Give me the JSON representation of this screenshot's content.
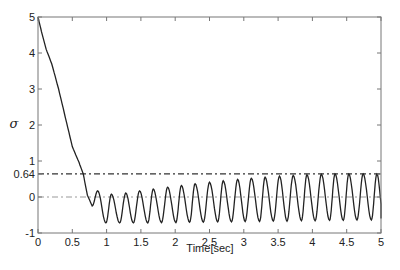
{
  "chart_data": {
    "type": "line",
    "title": "",
    "xlabel": "Time[sec]",
    "ylabel": "σ",
    "xlim": [
      0,
      5
    ],
    "ylim": [
      -1,
      5
    ],
    "grid": false,
    "legend": null,
    "x_ticks": [
      0,
      0.5,
      1,
      1.5,
      2,
      2.5,
      3,
      3.5,
      4,
      4.5,
      5
    ],
    "x_tick_labels": [
      "0",
      "0.5",
      "1",
      "1.5",
      "2",
      "2.5",
      "3",
      "3.5",
      "4",
      "4.5",
      "5"
    ],
    "y_ticks": [
      -1,
      0,
      0.64,
      1,
      2,
      3,
      4,
      5
    ],
    "y_tick_labels": [
      "-1",
      "0",
      "0.64",
      "1",
      "2",
      "3",
      "4",
      "5"
    ],
    "reference_lines": [
      {
        "name": "upper bound",
        "y": 0.64,
        "style": "dash-dot",
        "color": "#333333"
      },
      {
        "name": "zero",
        "y": 0,
        "style": "dash-dot",
        "color": "#999999"
      }
    ],
    "series": [
      {
        "name": "sigma",
        "color": "#222222",
        "descent": {
          "t": [
            0,
            0.05,
            0.12,
            0.2,
            0.3,
            0.4,
            0.5,
            0.6,
            0.66,
            0.72,
            0.79
          ],
          "y": [
            5,
            4.6,
            4.1,
            3.7,
            3.0,
            2.2,
            1.4,
            0.95,
            0.64,
            0.05,
            -0.25
          ]
        },
        "extrema": {
          "t": [
            0.79,
            0.87,
            0.99,
            1.07,
            1.19,
            1.28,
            1.39,
            1.48,
            1.6,
            1.68,
            1.8,
            1.89,
            2.01,
            2.09,
            2.21,
            2.29,
            2.41,
            2.5,
            2.62,
            2.7,
            2.82,
            2.91,
            3.02,
            3.11,
            3.23,
            3.31,
            3.43,
            3.52,
            3.63,
            3.72,
            3.84,
            3.92,
            4.04,
            4.13,
            4.25,
            4.33,
            4.45,
            4.53,
            4.65,
            4.74,
            4.86,
            4.94,
            5.04
          ],
          "y": [
            -0.25,
            0.17,
            -0.72,
            0.08,
            -0.72,
            0.11,
            -0.72,
            0.17,
            -0.72,
            0.22,
            -0.71,
            0.27,
            -0.71,
            0.32,
            -0.7,
            0.37,
            -0.7,
            0.41,
            -0.69,
            0.45,
            -0.69,
            0.49,
            -0.68,
            0.52,
            -0.68,
            0.55,
            -0.67,
            0.58,
            -0.67,
            0.6,
            -0.66,
            0.62,
            -0.66,
            0.63,
            -0.65,
            0.64,
            -0.65,
            0.64,
            -0.64,
            0.64,
            -0.64,
            0.64,
            -0.64
          ]
        }
      }
    ]
  },
  "plot": {
    "left": 38,
    "right": 381,
    "top": 17,
    "bottom": 233
  }
}
